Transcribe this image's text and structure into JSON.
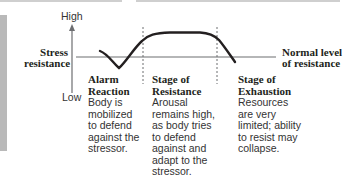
{
  "diagram": {
    "type": "stress-response-curve",
    "y_axis": {
      "title_line1": "Stress",
      "title_line2": "resistance",
      "high_label": "High",
      "low_label": "Low"
    },
    "baseline": {
      "label_line1": "Normal level",
      "label_line2": "of resistance"
    },
    "stages": [
      {
        "title_line1": "Alarm",
        "title_line2": "Reaction",
        "desc_lines": [
          "Body is",
          "mobilized",
          "to defend",
          "against the",
          "stressor."
        ]
      },
      {
        "title_line1": "Stage of",
        "title_line2": "Resistance",
        "desc_lines": [
          "Arousal",
          "remains high,",
          "as body tries",
          "to defend",
          "against and",
          "adapt to the",
          "stressor."
        ]
      },
      {
        "title_line1": "Stage of",
        "title_line2": "Exhaustion",
        "desc_lines": [
          "Resources",
          "are very",
          "limited; ability",
          "to resist may",
          "collapse."
        ]
      }
    ],
    "colors": {
      "curve": "#231f20",
      "baseline": "#6d6e71",
      "divider": "#6d6e71",
      "sidebar": "#b9b9b9"
    }
  }
}
